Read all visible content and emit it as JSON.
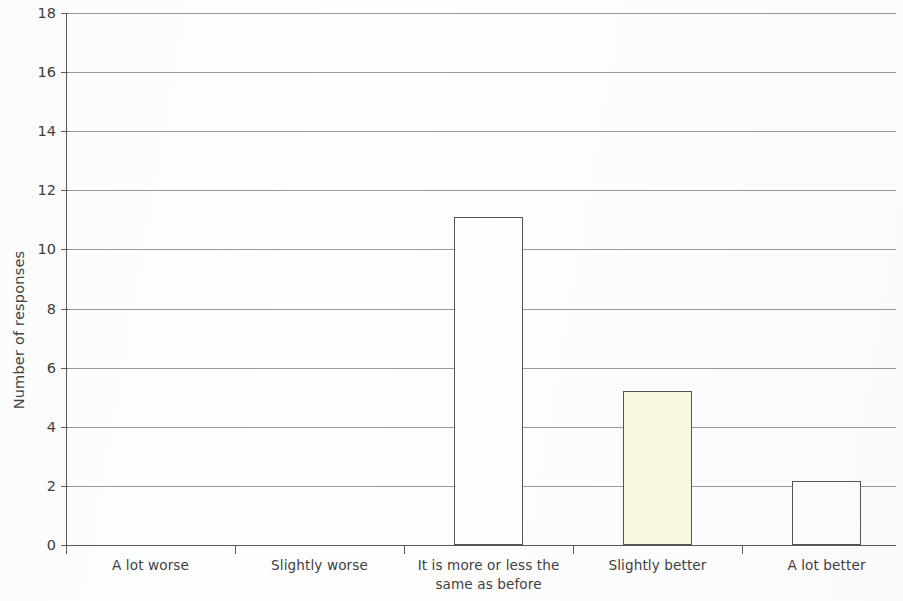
{
  "chart_data": {
    "type": "bar",
    "title": "",
    "xlabel": "",
    "ylabel": "Number of responses",
    "categories": [
      "A lot worse",
      "Slightly worse",
      "It is more or less the same as before",
      "Slightly better",
      "A lot better"
    ],
    "category_lines": [
      [
        "A lot worse"
      ],
      [
        "Slightly worse"
      ],
      [
        "It is more or less the",
        "same as before"
      ],
      [
        "Slightly better"
      ],
      [
        "A lot better"
      ]
    ],
    "values": [
      0,
      0,
      11.1,
      5.2,
      2.15
    ],
    "ylim": [
      0,
      18
    ],
    "ytick_values": [
      0,
      2,
      4,
      6,
      8,
      10,
      12,
      14,
      16,
      18
    ],
    "ytick_labels": [
      "0",
      "2",
      "4",
      "6",
      "8",
      "10",
      "12",
      "14",
      "16",
      "18"
    ],
    "grid": true,
    "legend": false,
    "bar_fill_colors": [
      "#ffffff",
      "#ffffff",
      "#ffffff",
      "#faf9e2",
      "#ffffff"
    ],
    "bar_edge_color": "#555555",
    "gridline_color": "#9a9a9a",
    "axis_color": "#5c5c5c",
    "background_color": "#fefefe"
  }
}
